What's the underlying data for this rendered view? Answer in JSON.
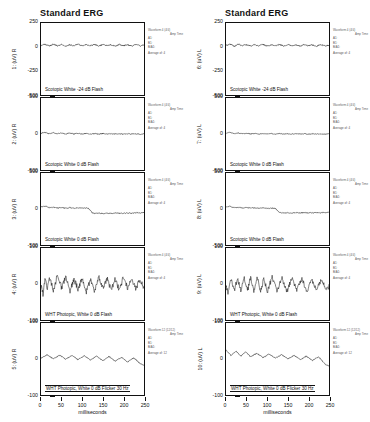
{
  "page": {
    "width": 370,
    "height": 422,
    "background": "#ffffff",
    "ink": "#111111"
  },
  "columns": [
    {
      "id": "right-eye",
      "title": "Standard ERG",
      "eye": "R",
      "xaxis": {
        "title": "milliseconds",
        "ticks": [
          "0",
          "50",
          "100",
          "150",
          "200",
          "250"
        ],
        "min": 0,
        "max": 250
      },
      "panels": [
        {
          "trace_number": "1",
          "ylabel": "1: (uV) R",
          "yticks": [
            "250",
            "0",
            "-250",
            "-500"
          ],
          "ymin": -500,
          "ymax": 250,
          "condition": "Scotopic  White -24 dB Flash",
          "boxed_condition": false,
          "annotation": {
            "title": "Waveform 4 (4/4)",
            "columns": "Amp   Time",
            "rows": [
              "A1:",
              "B1:",
              "B/A1:"
            ],
            "average": "Average of:  4"
          }
        },
        {
          "trace_number": "2",
          "ylabel": "2: (uV) R",
          "yticks": [
            "500",
            "0",
            "-500"
          ],
          "ymin": -500,
          "ymax": 500,
          "condition": "Scotopic  White 0 dB Flash",
          "boxed_condition": false,
          "annotation": {
            "title": "Waveform 4 (4/4)",
            "columns": "Amp   Time",
            "rows": [
              "A1:",
              "B1:",
              "B/A1:"
            ],
            "average": "Average of:  4"
          }
        },
        {
          "trace_number": "3",
          "ylabel": "3: (uV) R",
          "yticks": [
            "500",
            "0",
            "-500"
          ],
          "ymin": -500,
          "ymax": 500,
          "condition": "Scotopic  White 0 dB Flash",
          "boxed_condition": false,
          "annotation": {
            "title": "Waveform 4 (4/4)",
            "columns": "Amp   Time",
            "rows": [
              "A1:",
              "B1:",
              "B/A1:"
            ],
            "average": "Average of:  4"
          }
        },
        {
          "trace_number": "4",
          "ylabel": "4: (uV) R",
          "yticks": [
            "100",
            "0",
            "-100"
          ],
          "ymin": -100,
          "ymax": 100,
          "condition": "WHT Photopic,  White 0 dB Flash",
          "boxed_condition": false,
          "annotation": {
            "title": "Waveform 4 (4/4)",
            "columns": "Amp   Time",
            "rows": [
              "A1:",
              "B1:",
              "B/A1:"
            ],
            "average": "Average of:  4"
          }
        },
        {
          "trace_number": "5",
          "ylabel": "5: (uV) R",
          "yticks": [
            "100",
            "0",
            "-100"
          ],
          "ymin": -100,
          "ymax": 100,
          "condition": "WHT Photopic,  White 0 dB Flicker 30 Hz",
          "boxed_condition": true,
          "annotation": {
            "title": "Waveform 12 (12/12)",
            "columns": "Amp   Time",
            "rows": [
              "A1:",
              "B1:",
              "B/A1:"
            ],
            "average": "Average of:  12"
          }
        }
      ]
    },
    {
      "id": "left-eye",
      "title": "Standard ERG",
      "eye": "L",
      "xaxis": {
        "title": "milliseconds",
        "ticks": [
          "0",
          "50",
          "100",
          "150",
          "200",
          "250"
        ],
        "min": 0,
        "max": 250
      },
      "panels": [
        {
          "trace_number": "6",
          "ylabel": "6: (uV) L",
          "yticks": [
            "250",
            "0",
            "-250",
            "-500"
          ],
          "ymin": -500,
          "ymax": 250,
          "condition": "Scotopic  White -24 dB Flash",
          "boxed_condition": false,
          "annotation": {
            "title": "Waveform 4 (4/4)",
            "columns": "Amp   Time",
            "rows": [
              "A1:",
              "B1:",
              "B/A1:"
            ],
            "average": "Average of:  4"
          }
        },
        {
          "trace_number": "7",
          "ylabel": "7: (uV) L",
          "yticks": [
            "500",
            "0",
            "-500"
          ],
          "ymin": -500,
          "ymax": 500,
          "condition": "Scotopic  White 0 dB Flash",
          "boxed_condition": false,
          "annotation": {
            "title": "Waveform 4 (4/4)",
            "columns": "Amp   Time",
            "rows": [
              "A1:",
              "B1:",
              "B/A1:"
            ],
            "average": "Average of:  4"
          }
        },
        {
          "trace_number": "8",
          "ylabel": "8: (uV) L",
          "yticks": [
            "500",
            "0",
            "-500"
          ],
          "ymin": -500,
          "ymax": 500,
          "condition": "Scotopic  White 0 dB Flash",
          "boxed_condition": false,
          "annotation": {
            "title": "Waveform 4 (4/4)",
            "columns": "Amp   Time",
            "rows": [
              "A1:",
              "B1:",
              "B/A1:"
            ],
            "average": "Average of:  4"
          }
        },
        {
          "trace_number": "9",
          "ylabel": "9: (uV) L",
          "yticks": [
            "100",
            "0",
            "-100"
          ],
          "ymin": -100,
          "ymax": 100,
          "condition": "WHT Photopic,  White 0 dB Flash",
          "boxed_condition": false,
          "annotation": {
            "title": "Waveform 4 (4/4)",
            "columns": "Amp   Time",
            "rows": [
              "A1:",
              "B1:",
              "B/A1:"
            ],
            "average": "Average of:  4"
          }
        },
        {
          "trace_number": "10",
          "ylabel": "10: (uV) L",
          "yticks": [
            "100",
            "0",
            "-100"
          ],
          "ymin": -100,
          "ymax": 100,
          "condition": "WHT Photopic,  White 0 dB Flicker 30 Hz",
          "boxed_condition": true,
          "annotation": {
            "title": "Waveform 12 (12/12)",
            "columns": "Amp   Time",
            "rows": [
              "A1:",
              "B1:",
              "B/A1:"
            ],
            "average": "Average of:  12"
          }
        }
      ]
    }
  ],
  "chart_data": {
    "type": "line",
    "title": "Standard ERG",
    "xlabel": "milliseconds",
    "ylabel": "microvolts (uV)",
    "xlim": [
      0,
      250
    ],
    "grid": false,
    "legend": "none",
    "traces": [
      {
        "name": "1: (uV) R",
        "eye": "R",
        "condition": "Scotopic  White -24 dB Flash",
        "ylim": [
          -500,
          250
        ],
        "description": "Low-amplitude noisy flat trace oscillating about +20 uV",
        "baseline_uv": 20,
        "noise_amplitude_uv": 18,
        "x": [
          0,
          10,
          20,
          30,
          40,
          50,
          60,
          70,
          80,
          90,
          100,
          110,
          120,
          130,
          140,
          150,
          160,
          170,
          180,
          190,
          200,
          210,
          220,
          230,
          240,
          250
        ],
        "y": [
          15,
          28,
          10,
          30,
          12,
          26,
          8,
          24,
          14,
          30,
          10,
          25,
          12,
          28,
          8,
          26,
          14,
          22,
          10,
          27,
          13,
          24,
          9,
          25,
          12,
          20
        ]
      },
      {
        "name": "2: (uV) R",
        "eye": "R",
        "condition": "Scotopic  White 0 dB Flash",
        "ylim": [
          -500,
          500
        ],
        "description": "Flat near-zero trace with small ripple",
        "baseline_uv": 0,
        "noise_amplitude_uv": 18,
        "x": [
          0,
          10,
          20,
          30,
          40,
          50,
          60,
          70,
          80,
          90,
          100,
          110,
          120,
          130,
          140,
          150,
          160,
          170,
          180,
          190,
          200,
          210,
          220,
          230,
          240,
          250
        ],
        "y": [
          10,
          25,
          5,
          18,
          2,
          14,
          0,
          12,
          -2,
          10,
          0,
          8,
          -4,
          6,
          0,
          5,
          -2,
          4,
          0,
          5,
          -3,
          4,
          0,
          3,
          -2,
          2
        ]
      },
      {
        "name": "3: (uV) R",
        "eye": "R",
        "condition": "Scotopic  White 0 dB Flash",
        "ylim": [
          -500,
          500
        ],
        "description": "Flat trace that steps down by about 60 uV near 120 ms",
        "baseline_uv": 0,
        "step_at_ms": 120,
        "step_size_uv": -60,
        "x": [
          0,
          10,
          20,
          30,
          40,
          50,
          60,
          70,
          80,
          90,
          100,
          110,
          115,
          125,
          130,
          140,
          150,
          160,
          170,
          180,
          190,
          200,
          210,
          220,
          230,
          240,
          250
        ],
        "y": [
          30,
          40,
          20,
          25,
          15,
          20,
          12,
          18,
          10,
          16,
          12,
          14,
          10,
          -55,
          -60,
          -58,
          -62,
          -58,
          -60,
          -56,
          -60,
          -58,
          -55,
          -58,
          -52,
          -55,
          -48
        ]
      },
      {
        "name": "4: (uV) R",
        "eye": "R",
        "condition": "WHT Photopic,  White 0 dB Flash",
        "ylim": [
          -100,
          100
        ],
        "description": "High-frequency noisy trace about zero with initial negative deflection",
        "baseline_uv": 0,
        "noise_amplitude_uv": 22,
        "x": [
          0,
          5,
          10,
          15,
          20,
          30,
          40,
          50,
          60,
          70,
          80,
          90,
          100,
          110,
          120,
          130,
          140,
          150,
          160,
          170,
          180,
          190,
          200,
          210,
          220,
          230,
          240,
          250
        ],
        "y": [
          -5,
          -30,
          18,
          -15,
          22,
          -18,
          25,
          -12,
          20,
          -20,
          15,
          -15,
          18,
          -22,
          12,
          -18,
          20,
          -14,
          16,
          -18,
          14,
          -16,
          18,
          -12,
          15,
          -14,
          12,
          -10
        ]
      },
      {
        "name": "5: (uV) R",
        "eye": "R",
        "condition": "WHT Photopic,  White 0 dB Flicker 30 Hz",
        "ylim": [
          -100,
          100
        ],
        "description": "30 Hz flicker response with small periodic peaks decaying slightly downward",
        "baseline_uv": 0,
        "flicker_hz": 30,
        "peak_amplitude_uv": 12,
        "x": [
          0,
          15,
          30,
          45,
          60,
          75,
          90,
          105,
          120,
          135,
          150,
          165,
          180,
          195,
          210,
          225,
          240,
          250
        ],
        "y": [
          2,
          12,
          0,
          11,
          -1,
          10,
          -2,
          9,
          -3,
          8,
          -5,
          7,
          -6,
          5,
          -8,
          3,
          -12,
          -18
        ]
      },
      {
        "name": "6: (uV) L",
        "eye": "L",
        "condition": "Scotopic  White -24 dB Flash",
        "ylim": [
          -500,
          250
        ],
        "description": "Low-amplitude noisy flat trace oscillating about +20 uV",
        "baseline_uv": 20,
        "noise_amplitude_uv": 18,
        "x": [
          0,
          10,
          20,
          30,
          40,
          50,
          60,
          70,
          80,
          90,
          100,
          110,
          120,
          130,
          140,
          150,
          160,
          170,
          180,
          190,
          200,
          210,
          220,
          230,
          240,
          250
        ],
        "y": [
          18,
          30,
          8,
          28,
          14,
          24,
          10,
          26,
          12,
          28,
          8,
          24,
          14,
          26,
          10,
          24,
          12,
          22,
          8,
          25,
          14,
          22,
          10,
          24,
          12,
          18
        ]
      },
      {
        "name": "7: (uV) L",
        "eye": "L",
        "condition": "Scotopic  White 0 dB Flash",
        "ylim": [
          -500,
          500
        ],
        "description": "Flat near-zero trace with small ripple",
        "baseline_uv": 0,
        "noise_amplitude_uv": 15,
        "x": [
          0,
          10,
          20,
          30,
          40,
          50,
          60,
          70,
          80,
          90,
          100,
          110,
          120,
          130,
          140,
          150,
          160,
          170,
          180,
          190,
          200,
          210,
          220,
          230,
          240,
          250
        ],
        "y": [
          12,
          22,
          4,
          14,
          2,
          10,
          0,
          9,
          -2,
          8,
          0,
          6,
          -3,
          5,
          0,
          4,
          -2,
          4,
          0,
          3,
          -2,
          3,
          0,
          2,
          -2,
          2
        ]
      },
      {
        "name": "8: (uV) L",
        "eye": "L",
        "condition": "Scotopic  White 0 dB Flash",
        "ylim": [
          -500,
          500
        ],
        "description": "Flat trace that steps down by about 55 uV near 125 ms",
        "baseline_uv": 0,
        "step_at_ms": 125,
        "step_size_uv": -55,
        "x": [
          0,
          10,
          20,
          30,
          40,
          50,
          60,
          70,
          80,
          90,
          100,
          110,
          120,
          130,
          140,
          150,
          160,
          170,
          180,
          190,
          200,
          210,
          220,
          230,
          240,
          250
        ],
        "y": [
          28,
          38,
          18,
          24,
          14,
          20,
          12,
          16,
          10,
          15,
          10,
          12,
          8,
          -50,
          -55,
          -52,
          -56,
          -52,
          -55,
          -50,
          -54,
          -52,
          -50,
          -52,
          -48,
          -50
        ]
      },
      {
        "name": "9: (uV) L",
        "eye": "L",
        "condition": "WHT Photopic,  White 0 dB Flash",
        "ylim": [
          -100,
          100
        ],
        "description": "Periodic oscillatory response about zero after initial negative deflection",
        "baseline_uv": 0,
        "noise_amplitude_uv": 20,
        "x": [
          0,
          5,
          12,
          20,
          28,
          36,
          44,
          52,
          60,
          68,
          76,
          84,
          92,
          100,
          112,
          124,
          136,
          148,
          160,
          172,
          184,
          196,
          208,
          220,
          232,
          244,
          250
        ],
        "y": [
          -2,
          -28,
          16,
          -20,
          18,
          -22,
          20,
          -20,
          18,
          -22,
          18,
          -20,
          16,
          -22,
          18,
          -20,
          16,
          -20,
          18,
          -18,
          16,
          -20,
          14,
          -18,
          14,
          -16,
          -6
        ]
      },
      {
        "name": "10: (uV) L",
        "eye": "L",
        "condition": "WHT Photopic,  White 0 dB Flicker 30 Hz",
        "ylim": [
          -100,
          100
        ],
        "description": "30 Hz flicker response starting near +25 uV and decaying toward zero",
        "baseline_uv": 0,
        "flicker_hz": 30,
        "peak_amplitude_uv": 22,
        "x": [
          0,
          12,
          24,
          36,
          48,
          60,
          75,
          90,
          105,
          120,
          135,
          150,
          165,
          180,
          195,
          210,
          225,
          240,
          250
        ],
        "y": [
          25,
          10,
          22,
          8,
          20,
          6,
          16,
          4,
          14,
          2,
          12,
          0,
          10,
          -2,
          8,
          -4,
          6,
          -14,
          -20
        ]
      }
    ]
  }
}
